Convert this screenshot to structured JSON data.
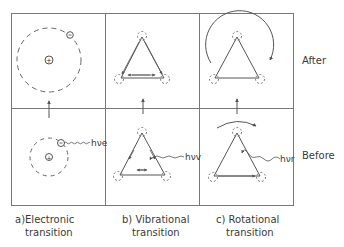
{
  "figure": {
    "rows": [
      {
        "id": "after",
        "label": "After"
      },
      {
        "id": "before",
        "label": "Before"
      }
    ],
    "columns": [
      {
        "id": "electronic",
        "caption_line1": "a)Electronic",
        "caption_line2": "transition",
        "photon": "hν",
        "photon_sub": "e"
      },
      {
        "id": "vibrational",
        "caption_line1": "b) Vibrational",
        "caption_line2": "transition",
        "photon": "hν",
        "photon_sub": "v"
      },
      {
        "id": "rotational",
        "caption_line1": "c) Rotational",
        "caption_line2": "transition",
        "photon": "hν",
        "photon_sub": "r"
      }
    ],
    "symbols": {
      "nucleus": "+",
      "electron": "−"
    },
    "colors": {
      "line": "#555555",
      "dashed": "#666666",
      "text": "#3a3a3a",
      "background": "#ffffff"
    }
  }
}
